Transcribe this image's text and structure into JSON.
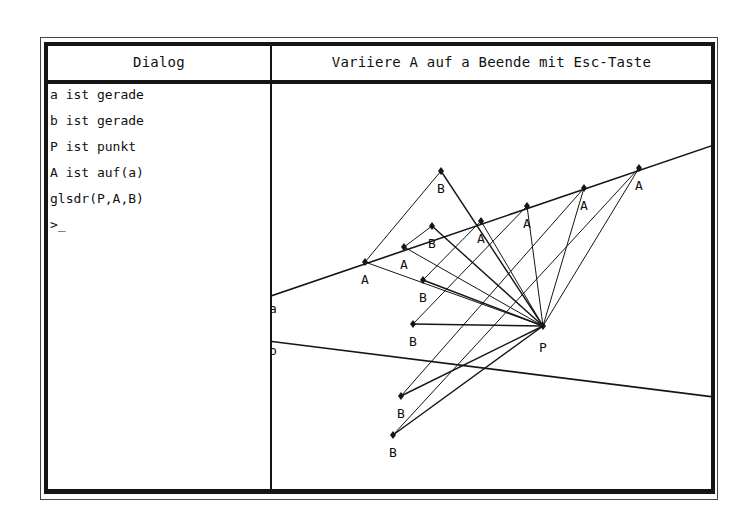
{
  "header": {
    "dialog_title": "Dialog",
    "canvas_title": "Variiere A auf a Beende mit Esc-Taste"
  },
  "dialog": {
    "lines": [
      "a ist gerade",
      "b ist gerade",
      "P ist punkt",
      "A ist auf(a)",
      "glsdr(P,A,B)",
      ">_"
    ]
  },
  "canvas": {
    "lines": {
      "a": {
        "label": "a",
        "from": [
          268,
          297
        ],
        "to": [
          714,
          145
        ]
      },
      "b": {
        "label": "b",
        "from": [
          268,
          341
        ],
        "to": [
          714,
          397
        ]
      }
    },
    "point_P": {
      "label": "P",
      "x": 543,
      "y": 326
    },
    "points_A": [
      {
        "label": "A",
        "x": 365,
        "y": 262
      },
      {
        "label": "A",
        "x": 404,
        "y": 247
      },
      {
        "label": "A",
        "x": 481,
        "y": 221
      },
      {
        "label": "A",
        "x": 527,
        "y": 206
      },
      {
        "label": "A",
        "x": 584,
        "y": 188
      },
      {
        "label": "A",
        "x": 639,
        "y": 168
      }
    ],
    "points_B": [
      {
        "label": "B",
        "x": 441,
        "y": 171
      },
      {
        "label": "B",
        "x": 432,
        "y": 226
      },
      {
        "label": "B",
        "x": 423,
        "y": 280
      },
      {
        "label": "B",
        "x": 413,
        "y": 324
      },
      {
        "label": "B",
        "x": 401,
        "y": 396
      },
      {
        "label": "B",
        "x": 393,
        "y": 435
      }
    ],
    "line_color": "#151515"
  }
}
